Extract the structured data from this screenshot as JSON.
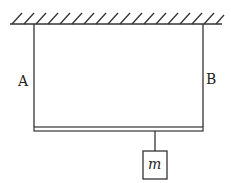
{
  "diagram": {
    "labels": {
      "left_rope": "A",
      "right_rope": "B",
      "mass": "m"
    },
    "elements": [
      "ceiling",
      "rope A",
      "rope B",
      "horizontal bar",
      "hanging string",
      "mass block"
    ],
    "colors": {
      "stroke": "#333333",
      "background": "#ffffff"
    }
  }
}
